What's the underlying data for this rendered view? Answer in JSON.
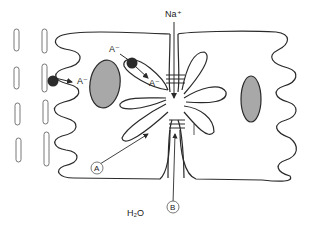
{
  "labels": {
    "na_plus": "Na⁺",
    "anion_1": "A⁻",
    "anion_2": "A⁻",
    "anion_3": "A⁻",
    "anion_4": "A⁻",
    "marker_a": "A",
    "marker_b": "B",
    "water": "H₂O"
  },
  "colors": {
    "outline": "#2a2a2a",
    "nucleus_fill": "#a8a8a8",
    "transporter_fill": "#2b2b2b",
    "background": "#ffffff"
  }
}
